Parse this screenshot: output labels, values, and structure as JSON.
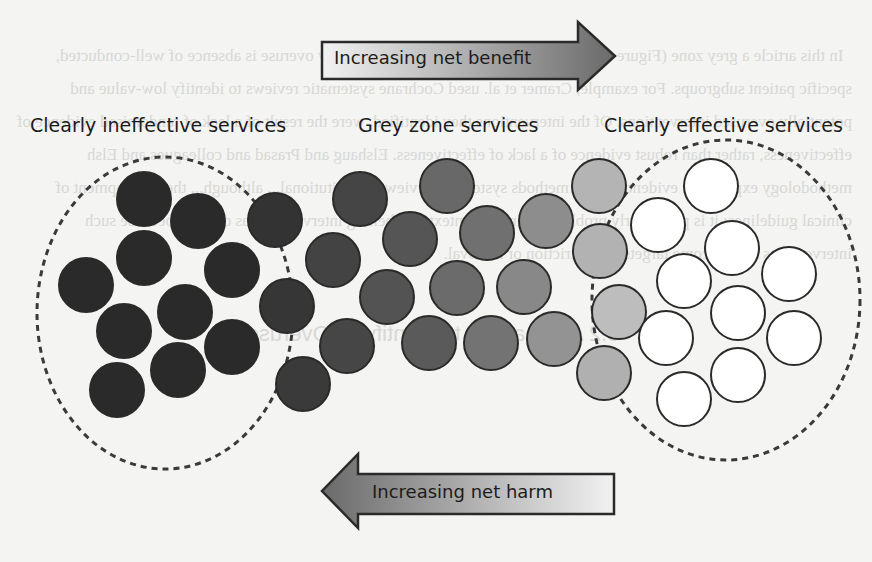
{
  "figure": {
    "top_arrow": {
      "label": "Increasing net benefit",
      "direction": "right"
    },
    "bottom_arrow": {
      "label": "Increasing net harm",
      "direction": "left"
    },
    "groups": [
      {
        "id": "ineffective",
        "label": "Clearly ineffective services",
        "fill": "#2a2a2a"
      },
      {
        "id": "grey",
        "label": "Grey zone services",
        "fill": "#6e6e6e"
      },
      {
        "id": "effective",
        "label": "Clearly effective services",
        "fill": "#ffffff"
      }
    ],
    "circle_radius": 27,
    "circles": [
      {
        "x": 144,
        "y": 199,
        "fill": "#2a2a2a"
      },
      {
        "x": 198,
        "y": 221,
        "fill": "#2a2a2a"
      },
      {
        "x": 144,
        "y": 258,
        "fill": "#2a2a2a"
      },
      {
        "x": 86,
        "y": 285,
        "fill": "#2a2a2a"
      },
      {
        "x": 232,
        "y": 270,
        "fill": "#2a2a2a"
      },
      {
        "x": 185,
        "y": 312,
        "fill": "#2a2a2a"
      },
      {
        "x": 124,
        "y": 331,
        "fill": "#2a2a2a"
      },
      {
        "x": 232,
        "y": 347,
        "fill": "#2a2a2a"
      },
      {
        "x": 178,
        "y": 370,
        "fill": "#2a2a2a"
      },
      {
        "x": 117,
        "y": 390,
        "fill": "#2a2a2a"
      },
      {
        "x": 275,
        "y": 220,
        "fill": "#333333"
      },
      {
        "x": 287,
        "y": 306,
        "fill": "#363636"
      },
      {
        "x": 303,
        "y": 384,
        "fill": "#3a3a3a"
      },
      {
        "x": 360,
        "y": 199,
        "fill": "#454545"
      },
      {
        "x": 333,
        "y": 260,
        "fill": "#434343"
      },
      {
        "x": 347,
        "y": 346,
        "fill": "#464646"
      },
      {
        "x": 410,
        "y": 239,
        "fill": "#555555"
      },
      {
        "x": 387,
        "y": 297,
        "fill": "#535353"
      },
      {
        "x": 429,
        "y": 343,
        "fill": "#5a5a5a"
      },
      {
        "x": 447,
        "y": 186,
        "fill": "#686868"
      },
      {
        "x": 487,
        "y": 233,
        "fill": "#707070"
      },
      {
        "x": 457,
        "y": 288,
        "fill": "#6b6b6b"
      },
      {
        "x": 491,
        "y": 343,
        "fill": "#737373"
      },
      {
        "x": 546,
        "y": 221,
        "fill": "#8d8d8d"
      },
      {
        "x": 524,
        "y": 287,
        "fill": "#888888"
      },
      {
        "x": 554,
        "y": 339,
        "fill": "#939393"
      },
      {
        "x": 599,
        "y": 186,
        "fill": "#b4b4b4"
      },
      {
        "x": 600,
        "y": 251,
        "fill": "#b2b2b2"
      },
      {
        "x": 619,
        "y": 312,
        "fill": "#bdbdbd"
      },
      {
        "x": 604,
        "y": 373,
        "fill": "#b0b0b0"
      },
      {
        "x": 711,
        "y": 186,
        "fill": "#ffffff"
      },
      {
        "x": 658,
        "y": 225,
        "fill": "#ffffff"
      },
      {
        "x": 732,
        "y": 248,
        "fill": "#ffffff"
      },
      {
        "x": 684,
        "y": 281,
        "fill": "#ffffff"
      },
      {
        "x": 789,
        "y": 274,
        "fill": "#ffffff"
      },
      {
        "x": 738,
        "y": 313,
        "fill": "#ffffff"
      },
      {
        "x": 666,
        "y": 338,
        "fill": "#ffffff"
      },
      {
        "x": 794,
        "y": 338,
        "fill": "#ffffff"
      },
      {
        "x": 738,
        "y": 375,
        "fill": "#ffffff"
      },
      {
        "x": 684,
        "y": 399,
        "fill": "#ffffff"
      }
    ],
    "colors": {
      "stroke": "#2a2a2a",
      "arrow_dark": "#6a6a6a",
      "arrow_light": "#eeeeee",
      "dash": "#3a3a3a"
    }
  },
  "bleed_through": {
    "body": "In this article a grey zone (Figure 1), a challenge for those seeking to identify overuse is absence of well-conducted, specific patient subgroups. For example, Cramer et al. used Cochrane systematic reviews to identify low-value and potentially overused interventions. Of the interventions they identified, were the result of a lack of randomised evidence of effectiveness, rather than robust evidence of a lack of effectiveness. Elshaug and Prasad and colleagues and Elsh methodology explicitly... evidence-based methods systematic reviews... institutional... although... the development of clinical guidelines; it is particularly problematic in the context of labelling interventions as overuse because such interventions may become targets for restriction or removal.",
    "heading": "3.2 Approaches to Identifying Overuse"
  }
}
